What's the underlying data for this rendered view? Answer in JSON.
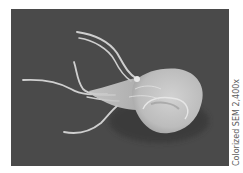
{
  "image": {
    "subject": "Giardia protozoan parasite",
    "description": "Scanning electron micrograph of a flagellated protozoan on a dark background",
    "colors": {
      "background": "#4a4a4a",
      "organism": "#d8d8d8",
      "organism_shadow": "#a8a8a8"
    }
  },
  "caption": {
    "text": "Colorized SEM 2,400x"
  }
}
